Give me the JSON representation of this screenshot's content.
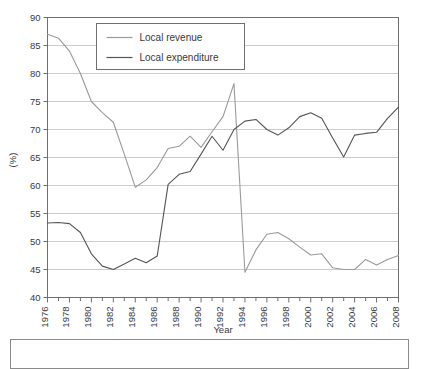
{
  "chart_data": {
    "type": "line",
    "title": "",
    "xlabel": "Year",
    "ylabel": "(%)",
    "xlim": [
      1976,
      2008
    ],
    "ylim": [
      40,
      90
    ],
    "ytick_step": 5,
    "xtick_step": 2,
    "grid": true,
    "legend_position": "top-left-inside",
    "x": [
      1976,
      1977,
      1978,
      1979,
      1980,
      1981,
      1982,
      1983,
      1984,
      1985,
      1986,
      1987,
      1988,
      1989,
      1990,
      1991,
      1992,
      1993,
      1994,
      1995,
      1996,
      1997,
      1998,
      1999,
      2000,
      2001,
      2002,
      2003,
      2004,
      2005,
      2006,
      2007,
      2008
    ],
    "xticklabels": [
      "1976",
      "1978",
      "1980",
      "1982",
      "1984",
      "1986",
      "1988",
      "1990",
      "1992",
      "1994",
      "1996",
      "1998",
      "2000",
      "2002",
      "2004",
      "2006",
      "2008"
    ],
    "yticklabels": [
      "40",
      "45",
      "50",
      "55",
      "60",
      "65",
      "70",
      "75",
      "80",
      "85",
      "90"
    ],
    "series": [
      {
        "name": "Local revenue",
        "color": "#9a9a9a",
        "values": [
          87.0,
          86.3,
          84.0,
          80.0,
          75.0,
          73.0,
          71.3,
          65.6,
          59.7,
          61.0,
          63.2,
          66.6,
          67.0,
          68.8,
          66.8,
          69.6,
          72.3,
          78.2,
          44.5,
          48.5,
          51.3,
          51.6,
          50.5,
          49.0,
          47.6,
          47.8,
          45.3,
          45.0,
          45.0,
          46.8,
          45.8,
          46.8,
          47.5
        ]
      },
      {
        "name": "Local expenditure",
        "color": "#555555",
        "values": [
          53.3,
          53.4,
          53.2,
          51.6,
          47.8,
          45.6,
          45.0,
          46.0,
          47.0,
          46.2,
          47.4,
          60.2,
          62.0,
          62.5,
          65.6,
          68.8,
          66.3,
          70.0,
          71.5,
          71.8,
          70.0,
          69.0,
          70.3,
          72.3,
          73.0,
          72.0,
          68.5,
          65.1,
          69.0,
          69.3,
          69.5,
          72.0,
          74.0
        ]
      }
    ],
    "legend": [
      {
        "label": "Local revenue",
        "color": "#9a9a9a"
      },
      {
        "label": "Local expenditure",
        "color": "#555555"
      }
    ]
  },
  "caption": {
    "text": ""
  }
}
